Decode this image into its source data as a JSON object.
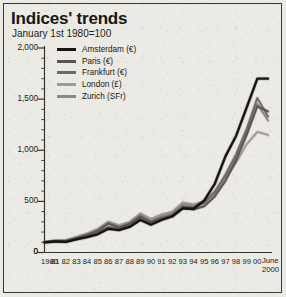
{
  "chart_data": {
    "type": "line",
    "title": "Indices' trends",
    "subtitle": "January 1st 1980=100",
    "xlabel": "",
    "ylabel": "",
    "ylim": [
      0,
      2000
    ],
    "yticks": [
      0,
      500,
      1000,
      1500,
      2000
    ],
    "ytick_labels": [
      "0",
      "500",
      "1,000",
      "1,500",
      "2,000"
    ],
    "grid": false,
    "legend_position": "top-left",
    "x_axis_end_label_line1": "June",
    "x_axis_end_label_line2": "2000",
    "categories": [
      "1980",
      "81",
      "82",
      "83",
      "84",
      "85",
      "86",
      "87",
      "88",
      "89",
      "90",
      "91",
      "92",
      "93",
      "94",
      "95",
      "96",
      "97",
      "98",
      "99",
      "00",
      "June 2000"
    ],
    "series": [
      {
        "name": "Amsterdam (€)",
        "color": "#14130d",
        "values": [
          100,
          108,
          104,
          128,
          150,
          178,
          232,
          218,
          250,
          318,
          272,
          318,
          352,
          432,
          428,
          508,
          672,
          940,
          1140,
          1420,
          1700,
          1700
        ]
      },
      {
        "name": "Paris (€)",
        "color": "#585550",
        "values": [
          100,
          112,
          110,
          140,
          172,
          212,
          282,
          244,
          282,
          352,
          296,
          338,
          360,
          438,
          420,
          452,
          548,
          700,
          900,
          1150,
          1430,
          1380
        ]
      },
      {
        "name": "Frankfurt (€)",
        "color": "#6e6b65",
        "values": [
          100,
          106,
          108,
          132,
          158,
          196,
          252,
          230,
          268,
          340,
          292,
          330,
          368,
          452,
          440,
          482,
          590,
          760,
          960,
          1210,
          1510,
          1330
        ]
      },
      {
        "name": "London (£)",
        "color": "#9e9b95",
        "values": [
          100,
          118,
          122,
          152,
          188,
          232,
          302,
          268,
          300,
          382,
          330,
          372,
          400,
          490,
          470,
          500,
          600,
          730,
          880,
          1060,
          1180,
          1150
        ]
      },
      {
        "name": "Zurich (SFr)",
        "color": "#8d8a84",
        "values": [
          100,
          110,
          112,
          142,
          176,
          220,
          292,
          252,
          288,
          368,
          312,
          356,
          386,
          472,
          458,
          492,
          578,
          742,
          930,
          1180,
          1452,
          1290
        ]
      }
    ]
  },
  "legend": {
    "items": [
      {
        "label": "Amsterdam (€)",
        "color": "#14130d",
        "thickness": "3.4px"
      },
      {
        "label": "Paris (€)",
        "color": "#585550",
        "thickness": "3px"
      },
      {
        "label": "Frankfurt (€)",
        "color": "#6e6b65",
        "thickness": "3px"
      },
      {
        "label": "London (£)",
        "color": "#9e9b95",
        "thickness": "3px"
      },
      {
        "label": "Zurich (SFr)",
        "color": "#8d8a84",
        "thickness": "3px"
      }
    ]
  },
  "axis": {
    "zero_label": "0"
  }
}
